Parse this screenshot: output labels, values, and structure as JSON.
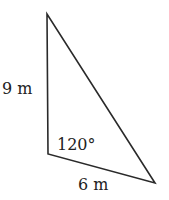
{
  "diagram": {
    "type": "triangle",
    "vertices": {
      "top": [
        47,
        14
      ],
      "bottom_left": [
        48,
        154
      ],
      "right": [
        155,
        183
      ]
    },
    "stroke_color": "#2a2a2a",
    "labels": {
      "left_side": "9 m",
      "bottom_side": "6 m",
      "angle": "120°"
    }
  }
}
